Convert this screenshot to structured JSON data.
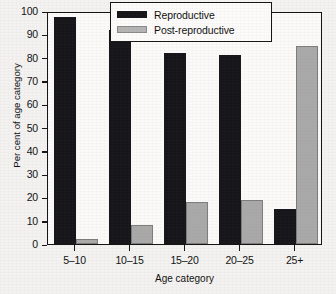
{
  "chart_data": {
    "type": "bar",
    "title": "",
    "subtitle": "",
    "xlabel": "Age category",
    "ylabel": "Per cent of age category",
    "categories": [
      "5–10",
      "10–15",
      "15–20",
      "20–25",
      "25+"
    ],
    "series": [
      {
        "name": "Reproductive",
        "color": "#16161a",
        "values": [
          97.5,
          92,
          82,
          81,
          15
        ]
      },
      {
        "name": "Post-reproductive",
        "color": "#a9a9a9",
        "values": [
          2,
          8,
          18,
          19,
          85
        ]
      }
    ],
    "ylim": [
      0,
      100
    ],
    "ytick_step": 10,
    "yticks": [
      0,
      10,
      20,
      30,
      40,
      50,
      60,
      70,
      80,
      90,
      100
    ],
    "ytick_labels": [
      "0",
      "10",
      "20",
      "30",
      "40",
      "50",
      "60",
      "70",
      "80",
      "90",
      "100"
    ],
    "grid": false,
    "legend_position": "top-right",
    "legend_entries": [
      "Reproductive",
      "Post-reproductive"
    ],
    "annotations": []
  },
  "axis": {
    "y_title": "Per cent of age category",
    "x_title": "Age category"
  },
  "legend": {
    "items": [
      {
        "label": "Reproductive"
      },
      {
        "label": "Post-reproductive"
      }
    ]
  }
}
